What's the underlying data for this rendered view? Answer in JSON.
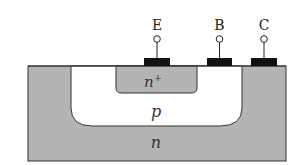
{
  "diagram": {
    "type": "npn-bjt-cross-section",
    "terminals": [
      {
        "id": "emitter",
        "label": "E"
      },
      {
        "id": "base",
        "label": "B"
      },
      {
        "id": "collector",
        "label": "C"
      }
    ],
    "regions": {
      "substrate": {
        "label": "n"
      },
      "base_well": {
        "label": "p"
      },
      "emitter_region": {
        "label": "n",
        "superscript": "+"
      }
    },
    "colors": {
      "doped_n": "#b4b4b4",
      "doped_p": "#ffffff",
      "contact": "#111111",
      "outline": "#333333"
    }
  }
}
